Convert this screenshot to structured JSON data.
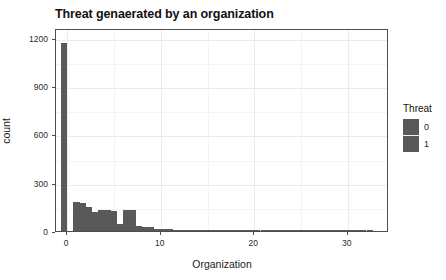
{
  "chart_data": {
    "type": "bar",
    "title": "Threat genaerated by an organization",
    "subtitle": "",
    "xlabel": "Organization",
    "ylabel": "count",
    "xlim": [
      -1.2,
      34.4
    ],
    "ylim": [
      0,
      1260
    ],
    "xticks": [
      0,
      10,
      20,
      30
    ],
    "xtick_labels": [
      "0",
      "10",
      "20",
      "30"
    ],
    "yticks": [
      0,
      300,
      600,
      900,
      1200
    ],
    "ytick_labels": [
      "0",
      "300",
      "600",
      "900",
      "1200"
    ],
    "y_minor_ticks": [
      150,
      450,
      750,
      1050
    ],
    "x_minor_ticks": [
      5,
      15,
      25
    ],
    "grid": true,
    "legend_position": "right",
    "bin_width": 0.66,
    "bar_color": "#595959",
    "panel_background": "#ffffff",
    "grid_color": "#ebebeb",
    "categories": [
      -0.33,
      0.33,
      1.0,
      1.66,
      2.33,
      3.0,
      3.66,
      4.33,
      5.0,
      5.66,
      6.33,
      7.0,
      7.66,
      8.33,
      9.0,
      9.66,
      10.33,
      11.0,
      11.66,
      12.33,
      13.0,
      13.66,
      14.33,
      15.0,
      15.66,
      16.33,
      17.0,
      17.66,
      18.33,
      19.0,
      19.66,
      20.33,
      21.0,
      21.66,
      22.33,
      23.0,
      23.66,
      24.33,
      25.0,
      25.66,
      26.33,
      27.0,
      27.66,
      28.33,
      29.0,
      29.66,
      30.33,
      31.0,
      31.66,
      32.33
    ],
    "values": [
      1168,
      0,
      180,
      175,
      150,
      120,
      130,
      130,
      125,
      45,
      128,
      128,
      30,
      28,
      25,
      12,
      14,
      14,
      5,
      5,
      5,
      8,
      3,
      2,
      2,
      2,
      2,
      2,
      2,
      2,
      2,
      2,
      2,
      2,
      2,
      2,
      2,
      2,
      2,
      2,
      2,
      2,
      2,
      2,
      2,
      2,
      2,
      2,
      2,
      4
    ],
    "series": [
      {
        "name": "0",
        "color": "#595959"
      },
      {
        "name": "1",
        "color": "#595959"
      }
    ],
    "legend": {
      "title": "Threat",
      "entries": [
        {
          "label": "0",
          "color": "#595959"
        },
        {
          "label": "1",
          "color": "#595959"
        }
      ]
    },
    "annotations": []
  },
  "legend": {
    "title": "Threat",
    "entries": [
      {
        "label": "0"
      },
      {
        "label": "1"
      }
    ]
  }
}
